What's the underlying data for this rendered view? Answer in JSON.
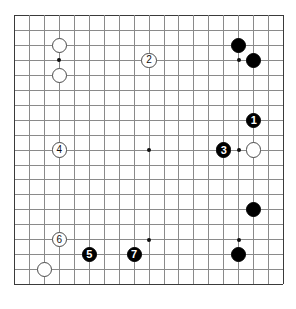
{
  "board": {
    "type": "go-board",
    "size": 19,
    "origin_x": 14,
    "origin_y": 15,
    "spacing": 14.95,
    "line_color": "#8a8a8a",
    "edge_color": "#3a3a3a",
    "background_color": "#ffffff",
    "stone_radius": 7.6,
    "star_radius": 1.9,
    "star_points": [
      {
        "col": 3,
        "row": 3
      },
      {
        "col": 9,
        "row": 3
      },
      {
        "col": 15,
        "row": 3
      },
      {
        "col": 3,
        "row": 9
      },
      {
        "col": 9,
        "row": 9
      },
      {
        "col": 15,
        "row": 9
      },
      {
        "col": 3,
        "row": 15
      },
      {
        "col": 9,
        "row": 15
      },
      {
        "col": 15,
        "row": 15
      }
    ],
    "stones": [
      {
        "id": "w-c3-r2",
        "color": "white",
        "col": 3,
        "row": 2,
        "label": ""
      },
      {
        "id": "w-c3-r4",
        "color": "white",
        "col": 3,
        "row": 4,
        "label": ""
      },
      {
        "id": "b-c15-r2",
        "color": "black",
        "col": 15,
        "row": 2,
        "label": ""
      },
      {
        "id": "b-c16-r3",
        "color": "black",
        "col": 16,
        "row": 3,
        "label": ""
      },
      {
        "id": "m1",
        "color": "black",
        "col": 16,
        "row": 7,
        "label": "1"
      },
      {
        "id": "m2",
        "color": "white",
        "col": 9,
        "row": 3,
        "label": "2"
      },
      {
        "id": "m3",
        "color": "black",
        "col": 14,
        "row": 9,
        "label": "3"
      },
      {
        "id": "w-c16-r9",
        "color": "white",
        "col": 16,
        "row": 9,
        "label": ""
      },
      {
        "id": "m4",
        "color": "white",
        "col": 3,
        "row": 9,
        "label": "4"
      },
      {
        "id": "b-c16-r13",
        "color": "black",
        "col": 16,
        "row": 13,
        "label": ""
      },
      {
        "id": "m6",
        "color": "white",
        "col": 3,
        "row": 15,
        "label": "6"
      },
      {
        "id": "m5",
        "color": "black",
        "col": 5,
        "row": 16,
        "label": "5"
      },
      {
        "id": "m7",
        "color": "black",
        "col": 8,
        "row": 16,
        "label": "7"
      },
      {
        "id": "b-c15-r16",
        "color": "black",
        "col": 15,
        "row": 16,
        "label": ""
      },
      {
        "id": "w-c2-r17",
        "color": "white",
        "col": 2,
        "row": 17,
        "label": ""
      }
    ]
  },
  "diagram": {
    "title": "",
    "caption": "",
    "move_sequence": [
      "1",
      "2",
      "3",
      "4",
      "5",
      "6",
      "7"
    ]
  }
}
